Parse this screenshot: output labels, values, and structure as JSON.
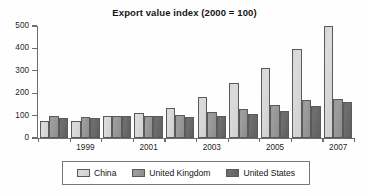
{
  "chart_data": {
    "type": "bar",
    "title": "Export value index (2000 = 100)",
    "xlabel": "",
    "ylabel": "",
    "ylim": [
      0,
      500
    ],
    "yticks": [
      0,
      100,
      200,
      300,
      400,
      500
    ],
    "ytick_labels": [
      "0",
      "100",
      "200",
      "300",
      "400",
      "500"
    ],
    "grid": false,
    "legend_position": "bottom",
    "categories": [
      "1998",
      "1999",
      "2000",
      "2001",
      "2002",
      "2003",
      "2004",
      "2005",
      "2006",
      "2007"
    ],
    "xtick_labels_visible": [
      "",
      "1999",
      "",
      "2001",
      "",
      "2003",
      "",
      "2005",
      "",
      "2007"
    ],
    "series": [
      {
        "name": "China",
        "color": "#d8d8d8",
        "values": [
          75,
          78,
          100,
          110,
          135,
          182,
          244,
          313,
          399,
          500
        ]
      },
      {
        "name": "United Kingdom",
        "color": "#979797",
        "values": [
          97,
          96,
          100,
          99,
          104,
          114,
          130,
          147,
          169,
          172
        ]
      },
      {
        "name": "United States",
        "color": "#676767",
        "values": [
          90,
          89,
          100,
          98,
          93,
          100,
          109,
          122,
          142,
          161
        ]
      }
    ]
  },
  "legend": {
    "items": [
      {
        "label": "China"
      },
      {
        "label": "United Kingdom"
      },
      {
        "label": "United States"
      }
    ]
  },
  "colors": {
    "series_china": "#d8d8d8",
    "series_uk": "#979797",
    "series_us": "#676767",
    "axis": "#6e6e6e",
    "text": "#1c1c1c",
    "background": "#ffffff"
  }
}
